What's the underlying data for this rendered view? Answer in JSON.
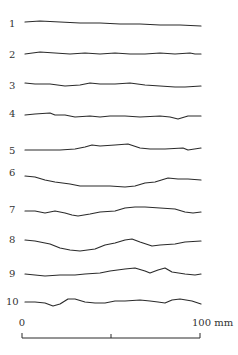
{
  "figure": {
    "type": "surface-profile-diagram",
    "profiles": [
      {
        "label": "1",
        "label_y": 27,
        "points": [
          [
            25,
            22
          ],
          [
            40,
            21
          ],
          [
            60,
            22
          ],
          [
            80,
            23
          ],
          [
            100,
            23
          ],
          [
            120,
            24
          ],
          [
            140,
            24
          ],
          [
            160,
            25
          ],
          [
            180,
            25
          ],
          [
            201,
            26
          ]
        ]
      },
      {
        "label": "2",
        "label_y": 58,
        "points": [
          [
            25,
            54
          ],
          [
            40,
            52
          ],
          [
            55,
            53
          ],
          [
            70,
            54
          ],
          [
            85,
            53
          ],
          [
            100,
            54
          ],
          [
            115,
            53
          ],
          [
            130,
            54
          ],
          [
            145,
            54
          ],
          [
            160,
            53
          ],
          [
            175,
            54
          ],
          [
            190,
            53
          ],
          [
            195,
            54
          ],
          [
            201,
            54
          ]
        ]
      },
      {
        "label": "3",
        "label_y": 89,
        "points": [
          [
            25,
            83
          ],
          [
            35,
            84
          ],
          [
            50,
            84
          ],
          [
            65,
            86
          ],
          [
            80,
            85
          ],
          [
            90,
            83
          ],
          [
            100,
            84
          ],
          [
            115,
            84
          ],
          [
            130,
            83
          ],
          [
            145,
            85
          ],
          [
            160,
            86
          ],
          [
            175,
            87
          ],
          [
            185,
            87
          ],
          [
            201,
            86
          ]
        ]
      },
      {
        "label": "4",
        "label_y": 117,
        "points": [
          [
            25,
            115
          ],
          [
            35,
            114
          ],
          [
            50,
            113
          ],
          [
            55,
            115
          ],
          [
            65,
            115
          ],
          [
            75,
            117
          ],
          [
            90,
            116
          ],
          [
            100,
            117
          ],
          [
            110,
            116
          ],
          [
            125,
            116
          ],
          [
            140,
            117
          ],
          [
            160,
            116
          ],
          [
            170,
            117
          ],
          [
            178,
            119
          ],
          [
            188,
            116
          ],
          [
            201,
            116
          ]
        ]
      },
      {
        "label": "5",
        "label_y": 154,
        "points": [
          [
            25,
            150
          ],
          [
            40,
            150
          ],
          [
            60,
            150
          ],
          [
            75,
            149
          ],
          [
            85,
            147
          ],
          [
            92,
            145
          ],
          [
            100,
            146
          ],
          [
            115,
            145
          ],
          [
            128,
            144
          ],
          [
            140,
            148
          ],
          [
            150,
            149
          ],
          [
            165,
            149
          ],
          [
            183,
            148
          ],
          [
            188,
            150
          ],
          [
            201,
            148
          ]
        ]
      },
      {
        "label": "6",
        "label_y": 176,
        "points": [
          [
            25,
            176
          ],
          [
            35,
            177
          ],
          [
            45,
            180
          ],
          [
            55,
            182
          ],
          [
            70,
            184
          ],
          [
            80,
            186
          ],
          [
            95,
            186
          ],
          [
            110,
            186
          ],
          [
            125,
            187
          ],
          [
            135,
            186
          ],
          [
            145,
            183
          ],
          [
            155,
            182
          ],
          [
            168,
            178
          ],
          [
            178,
            179
          ],
          [
            188,
            179
          ],
          [
            201,
            180
          ]
        ]
      },
      {
        "label": "7",
        "label_y": 213,
        "points": [
          [
            25,
            211
          ],
          [
            35,
            211
          ],
          [
            45,
            213
          ],
          [
            55,
            211
          ],
          [
            65,
            213
          ],
          [
            72,
            215
          ],
          [
            78,
            216
          ],
          [
            90,
            214
          ],
          [
            100,
            212
          ],
          [
            115,
            211
          ],
          [
            125,
            208
          ],
          [
            135,
            207
          ],
          [
            145,
            207
          ],
          [
            160,
            208
          ],
          [
            175,
            209
          ],
          [
            185,
            212
          ],
          [
            193,
            213
          ],
          [
            201,
            212
          ]
        ]
      },
      {
        "label": "8",
        "label_y": 243,
        "points": [
          [
            25,
            240
          ],
          [
            35,
            241
          ],
          [
            50,
            244
          ],
          [
            60,
            248
          ],
          [
            70,
            250
          ],
          [
            80,
            251
          ],
          [
            95,
            249
          ],
          [
            105,
            245
          ],
          [
            115,
            243
          ],
          [
            125,
            240
          ],
          [
            132,
            239
          ],
          [
            140,
            242
          ],
          [
            152,
            246
          ],
          [
            160,
            245
          ],
          [
            175,
            244
          ],
          [
            185,
            242
          ],
          [
            201,
            241
          ]
        ]
      },
      {
        "label": "9",
        "label_y": 277,
        "points": [
          [
            25,
            274
          ],
          [
            35,
            275
          ],
          [
            45,
            276
          ],
          [
            60,
            275
          ],
          [
            75,
            275
          ],
          [
            85,
            274
          ],
          [
            100,
            273
          ],
          [
            110,
            271
          ],
          [
            125,
            269
          ],
          [
            135,
            268
          ],
          [
            145,
            271
          ],
          [
            150,
            273
          ],
          [
            158,
            270
          ],
          [
            165,
            268
          ],
          [
            172,
            272
          ],
          [
            185,
            274
          ],
          [
            195,
            275
          ],
          [
            201,
            274
          ]
        ]
      },
      {
        "label": "10",
        "label_y": 305,
        "points": [
          [
            25,
            302
          ],
          [
            35,
            302
          ],
          [
            45,
            303
          ],
          [
            53,
            306
          ],
          [
            60,
            304
          ],
          [
            68,
            299
          ],
          [
            75,
            299
          ],
          [
            85,
            302
          ],
          [
            95,
            303
          ],
          [
            105,
            303
          ],
          [
            115,
            301
          ],
          [
            125,
            301
          ],
          [
            140,
            300
          ],
          [
            150,
            301
          ],
          [
            158,
            302
          ],
          [
            165,
            303
          ],
          [
            172,
            300
          ],
          [
            180,
            299
          ],
          [
            192,
            301
          ],
          [
            201,
            304
          ]
        ]
      }
    ],
    "scale_bar": {
      "start_label": "0",
      "end_label": "100 mm",
      "x_start": 22,
      "x_mid": 111,
      "x_end": 200,
      "y": 338
    }
  }
}
